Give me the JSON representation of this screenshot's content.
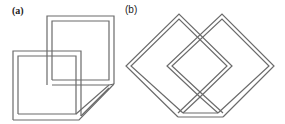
{
  "figure": {
    "panels": [
      {
        "id": "a",
        "label": "(a)",
        "description": "Two overlapping double-outlined squares joined by a folded diagonal strip"
      },
      {
        "id": "b",
        "label": "(b)",
        "description": "Two overlapping double-outlined diamonds with a flat folded bottom edge"
      }
    ],
    "colors": {
      "stroke": "#6b6b6b",
      "background": "#ffffff"
    }
  }
}
